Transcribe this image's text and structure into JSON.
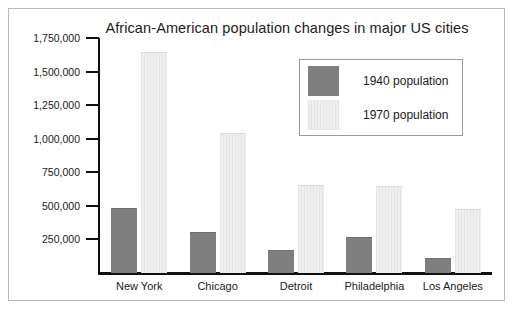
{
  "figure": {
    "border_color": "#b9b9b9",
    "background": "#ffffff"
  },
  "chart_data": {
    "type": "bar",
    "title": "African-American population changes in major US cities",
    "xlabel": "",
    "ylabel": "",
    "categories": [
      "New York",
      "Chicago",
      "Detroit",
      "Philadelphia",
      "Los Angeles"
    ],
    "series": [
      {
        "name": "1940 population",
        "color": "#7f7f7f",
        "values": [
          484000,
          305000,
          171000,
          268000,
          112000
        ]
      },
      {
        "name": "1970 population",
        "color": "#e9e9e9",
        "values": [
          1646000,
          1043000,
          656000,
          648000,
          477000
        ]
      }
    ],
    "ylim": [
      0,
      1750000
    ],
    "ytick_values": [
      250000,
      500000,
      750000,
      1000000,
      1250000,
      1500000,
      1750000
    ],
    "ytick_labels": [
      "250,000",
      "500,000",
      "750,000",
      "1,000,000",
      "1,250,000",
      "1,500,000",
      "1,750,000"
    ],
    "grid": false,
    "legend_position": "upper right",
    "legend_entries": [
      "1940 population",
      "1970 population"
    ]
  }
}
